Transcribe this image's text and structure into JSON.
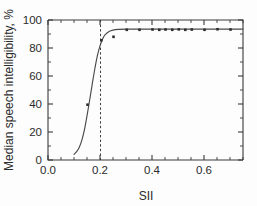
{
  "chart_data": {
    "type": "scatter",
    "title": "",
    "subtitle": "",
    "xlabel": "SII",
    "ylabel": "Median speech intelligibility, %",
    "xlim": [
      0.0,
      0.75
    ],
    "ylim": [
      0,
      100
    ],
    "xticks": [
      0.0,
      0.2,
      0.4,
      0.6
    ],
    "xtick_labels": [
      "0.0",
      "0.2",
      "0.4",
      "0.6"
    ],
    "x_minor_ticks": [
      0.05,
      0.1,
      0.15,
      0.25,
      0.3,
      0.35,
      0.45,
      0.5,
      0.55,
      0.65,
      0.7,
      0.75
    ],
    "yticks": [
      0,
      20,
      40,
      60,
      80,
      100
    ],
    "ytick_labels": [
      "0",
      "20",
      "40",
      "60",
      "80",
      "100"
    ],
    "y_minor_ticks": [
      10,
      30,
      50,
      70,
      90
    ],
    "grid": false,
    "legend": "none",
    "frame": "box",
    "series": [
      {
        "name": "Measured median intelligibility",
        "type": "scatter",
        "marker": "square",
        "color": "#2f2f2f",
        "points": [
          {
            "x": 0.152,
            "y": 39.5
          },
          {
            "x": 0.205,
            "y": 85.5
          },
          {
            "x": 0.252,
            "y": 88.0
          },
          {
            "x": 0.303,
            "y": 93.0
          },
          {
            "x": 0.352,
            "y": 93.0
          },
          {
            "x": 0.402,
            "y": 93.2
          },
          {
            "x": 0.428,
            "y": 93.0
          },
          {
            "x": 0.452,
            "y": 93.2
          },
          {
            "x": 0.478,
            "y": 93.0
          },
          {
            "x": 0.503,
            "y": 93.3
          },
          {
            "x": 0.528,
            "y": 93.0
          },
          {
            "x": 0.553,
            "y": 93.2
          },
          {
            "x": 0.602,
            "y": 93.0
          },
          {
            "x": 0.652,
            "y": 93.4
          },
          {
            "x": 0.702,
            "y": 93.2
          }
        ]
      },
      {
        "name": "Fitted logistic curve",
        "type": "line",
        "color": "#4a4a4a",
        "points": [
          {
            "x": 0.1,
            "y": 4.0
          },
          {
            "x": 0.11,
            "y": 6.0
          },
          {
            "x": 0.12,
            "y": 9.0
          },
          {
            "x": 0.13,
            "y": 14.0
          },
          {
            "x": 0.14,
            "y": 21.5
          },
          {
            "x": 0.15,
            "y": 31.5
          },
          {
            "x": 0.16,
            "y": 42.5
          },
          {
            "x": 0.17,
            "y": 54.0
          },
          {
            "x": 0.18,
            "y": 65.0
          },
          {
            "x": 0.19,
            "y": 74.5
          },
          {
            "x": 0.2,
            "y": 81.5
          },
          {
            "x": 0.21,
            "y": 86.5
          },
          {
            "x": 0.22,
            "y": 89.5
          },
          {
            "x": 0.235,
            "y": 91.8
          },
          {
            "x": 0.25,
            "y": 92.8
          },
          {
            "x": 0.27,
            "y": 93.3
          },
          {
            "x": 0.3,
            "y": 93.5
          },
          {
            "x": 0.4,
            "y": 93.5
          },
          {
            "x": 0.5,
            "y": 93.5
          },
          {
            "x": 0.6,
            "y": 93.5
          },
          {
            "x": 0.7,
            "y": 93.5
          },
          {
            "x": 0.75,
            "y": 93.5
          }
        ]
      }
    ],
    "annotations": [
      {
        "name": "sii-threshold",
        "type": "vertical-dashed-line",
        "x": 0.202,
        "y_from": 0,
        "y_to": 100,
        "label": ""
      }
    ]
  }
}
